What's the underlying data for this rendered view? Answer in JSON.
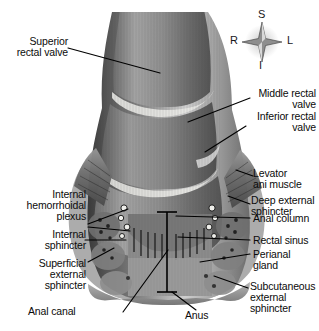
{
  "figure": {
    "background_color": "#ffffff",
    "text_color": "#0b0b0b",
    "illustration_style": "grayscale anatomical halftone"
  },
  "compass": {
    "name": "orientation-rose",
    "superior": "S",
    "inferior": "I",
    "right": "R",
    "left": "L"
  },
  "labels": {
    "superior_rectal_valve": "Superior\nrectal valve",
    "middle_rectal_valve": "Middle rectal\nvalve",
    "inferior_rectal_valve": "Inferior rectal\nvalve",
    "internal_hemorrhoidal_plexus": "Internal\nhemorrhoidal\nplexus",
    "internal_sphincter": "Internal\nsphincter",
    "superficial_external_sphincter": "Superficial\nexternal\nsphincter",
    "anal_canal": "Anal canal",
    "anus": "Anus",
    "levator_ani_muscle": "Levator\nani muscle",
    "deep_external_sphincter": "Deep external\nsphincter",
    "anal_column": "Anal column",
    "rectal_sinus": "Rectal sinus",
    "perianal_gland": "Perianal\ngland",
    "subcutaneous_external_sphincter": "Subcutaneous\nexternal\nsphincter"
  }
}
